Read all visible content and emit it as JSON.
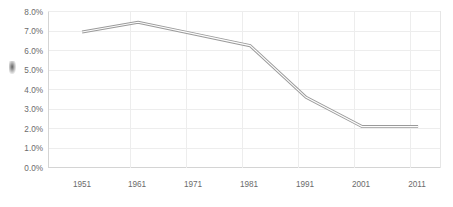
{
  "chart_data": {
    "type": "line",
    "title": "",
    "subtitle": "",
    "xlabel": "",
    "ylabel": "",
    "categories": [
      "1951",
      "1961",
      "1971",
      "1981",
      "1991",
      "2001",
      "2011"
    ],
    "values": [
      6.95,
      7.45,
      6.85,
      6.25,
      3.6,
      2.1,
      2.1
    ],
    "value_suffix": "%",
    "ylim": [
      0.0,
      8.0
    ],
    "ytick_step": 1.0,
    "ytick_labels": [
      "0.0%",
      "1.0%",
      "2.0%",
      "3.0%",
      "4.0%",
      "5.0%",
      "6.0%",
      "7.0%",
      "8.0%"
    ],
    "ytick_values": [
      0.0,
      1.0,
      2.0,
      3.0,
      4.0,
      5.0,
      6.0,
      7.0,
      8.0
    ],
    "xtick_labels": [
      "1951",
      "1961",
      "1971",
      "1981",
      "1991",
      "2001",
      "2011"
    ],
    "grid": {
      "horizontal": true,
      "vertical": true,
      "color": "#ededed"
    },
    "legend": {
      "visible": false,
      "position": "none",
      "entries": []
    },
    "series": [
      {
        "name": "series-1",
        "values": [
          6.95,
          7.45,
          6.85,
          6.25,
          3.6,
          2.1,
          2.1
        ],
        "line_color": "#9a9a9a",
        "line_highlight_color": "#fdfdfd",
        "markers": false
      }
    ],
    "annotations": [],
    "background_color": "#ffffff",
    "plot_border_color": "#e6e6e6"
  }
}
